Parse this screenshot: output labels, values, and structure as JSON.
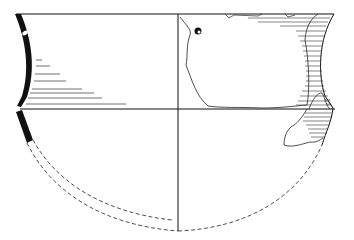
{
  "figure": {
    "type": "archaeological pottery profile drawing",
    "caption": "",
    "views": {
      "left_half": "section profile (solid black wall, dashed reconstruction of lower body)",
      "right_half": "exterior view with preserved sherd outline and horizontal hatching"
    },
    "colors": {
      "ink": "#111111",
      "background": "#ffffff",
      "hatch": "#333333"
    },
    "geometry": {
      "rim_y": 14,
      "carination_y": 109,
      "axis_x": 178,
      "base_y": 230,
      "left_rim_x": 16,
      "right_rim_x": 334
    }
  }
}
